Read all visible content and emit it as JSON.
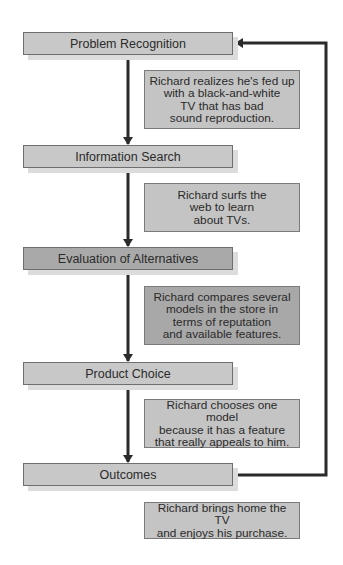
{
  "diagram": {
    "type": "flowchart",
    "steps": [
      {
        "label": "Problem Recognition"
      },
      {
        "label": "Information Search"
      },
      {
        "label": "Evaluation of Alternatives"
      },
      {
        "label": "Product Choice"
      },
      {
        "label": "Outcomes"
      }
    ],
    "descriptions": [
      {
        "text": "Richard realizes he's fed up\nwith a black-and-white\nTV that has bad\nsound reproduction."
      },
      {
        "text": "Richard surfs the\nweb to learn\nabout TVs."
      },
      {
        "text": "Richard compares several\nmodels in the store in\nterms of reputation\nand available features."
      },
      {
        "text": "Richard chooses one model\nbecause it has a feature\nthat really appeals to him."
      },
      {
        "text": "Richard brings home the TV\nand enjoys his purchase."
      }
    ],
    "feedback_loop": {
      "from": "Outcomes",
      "to": "Problem Recognition"
    },
    "colors": {
      "step_fill": "#c8c8c8",
      "highlight_fill": "#a9a9a9",
      "arrow": "#2b2b2b"
    }
  }
}
